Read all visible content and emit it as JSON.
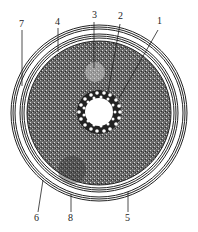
{
  "diagram": {
    "type": "cross-section",
    "labels": [
      {
        "id": "1",
        "text": "1"
      },
      {
        "id": "2",
        "text": "2"
      },
      {
        "id": "3",
        "text": "3"
      },
      {
        "id": "4",
        "text": "4"
      },
      {
        "id": "5",
        "text": "5"
      },
      {
        "id": "6",
        "text": "6"
      },
      {
        "id": "7",
        "text": "7"
      },
      {
        "id": "8",
        "text": "8"
      }
    ],
    "colors": {
      "ink": "#222222",
      "texture": "#555555",
      "background": "#ffffff"
    }
  }
}
